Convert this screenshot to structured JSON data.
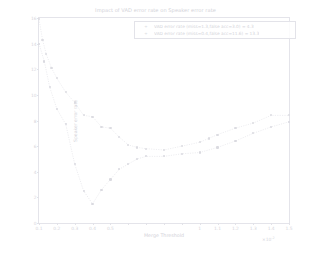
{
  "chart_data": {
    "type": "scatter",
    "title": "Impact of VAD error rate on Speaker error rate",
    "xlabel": "Merge Threshold",
    "ylabel": "Speaker error rate",
    "xlim": [
      0.1,
      1.5
    ],
    "ylim": [
      0,
      16
    ],
    "xticks": [
      "0.1",
      "0.2",
      "0.3",
      "0.4",
      "0.5",
      "1",
      "1.1",
      "1.2",
      "1.3",
      "1.4",
      "1.5"
    ],
    "yticks": [
      "0",
      "2",
      "4",
      "6",
      "8",
      "10",
      "12",
      "14",
      "16"
    ],
    "offset_label": "×10",
    "offset_exponent": "-2",
    "grid": false,
    "legend_position": "upper right",
    "series": [
      {
        "name": "VAD error rate (miss=1.3,false acc=3.0) = 4.3",
        "marker": "+",
        "color": "#dcdce2",
        "x": [
          0.1,
          0.12,
          0.14,
          0.17,
          0.2,
          0.25,
          0.3,
          0.35,
          0.4,
          0.45,
          0.5,
          0.55,
          0.6,
          0.65,
          0.7,
          0.8,
          0.9,
          1.0,
          1.05,
          1.1,
          1.2,
          1.3,
          1.4,
          1.5
        ],
        "y": [
          15.9,
          14.3,
          13.2,
          12.1,
          11.3,
          10.2,
          9.4,
          8.4,
          8.3,
          7.5,
          7.4,
          6.7,
          6.1,
          5.9,
          5.8,
          5.7,
          6.0,
          6.3,
          6.6,
          6.9,
          7.4,
          7.8,
          8.4,
          8.4
        ]
      },
      {
        "name": "VAD error rate (miss=0.4,false acc=11.6) = 13.3",
        "marker": "+",
        "color": "#dadae0",
        "x": [
          0.1,
          0.13,
          0.16,
          0.2,
          0.25,
          0.3,
          0.35,
          0.4,
          0.45,
          0.5,
          0.55,
          0.6,
          0.65,
          0.7,
          0.8,
          0.9,
          1.0,
          1.1,
          1.2,
          1.3,
          1.4,
          1.5
        ],
        "y": [
          14.0,
          12.6,
          10.6,
          8.9,
          7.7,
          4.6,
          2.5,
          1.5,
          2.6,
          3.4,
          4.2,
          4.6,
          5.0,
          5.2,
          5.2,
          5.4,
          5.5,
          5.9,
          6.4,
          7.0,
          7.5,
          7.9
        ]
      }
    ]
  },
  "legend": {
    "entries": [
      {
        "marker": "+",
        "label": "VAD error rate (miss=1.3,false acc=3.0) = 4.3"
      },
      {
        "marker": "+",
        "label": "VAD error rate (miss=0.4,false acc=11.6) = 13.3"
      }
    ]
  }
}
